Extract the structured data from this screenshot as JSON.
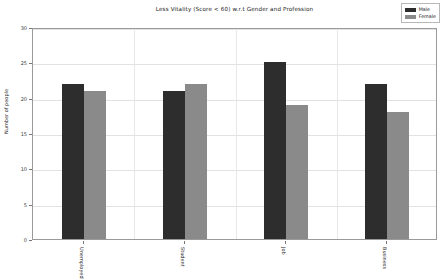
{
  "chart_data": {
    "type": "bar",
    "title": "Less Vitality (Score < 60) w.r.t Gender and Profession",
    "xlabel": "",
    "ylabel": "Number of people",
    "categories": [
      "Unemployed",
      "Student",
      "Job",
      "Business"
    ],
    "series": [
      {
        "name": "Male",
        "color": "#2d2d2d",
        "values": [
          22,
          21,
          25,
          22
        ]
      },
      {
        "name": "Female",
        "color": "#8a8a8a",
        "values": [
          21,
          22,
          19,
          18
        ]
      }
    ],
    "ylim": [
      0,
      30
    ],
    "yticks": [
      0,
      5,
      10,
      15,
      20,
      25,
      30
    ],
    "ytick_labels": [
      "0",
      "5",
      "10",
      "15",
      "20",
      "25",
      "30"
    ],
    "grid": true,
    "legend_position": "upper right"
  },
  "legend": {
    "entries": [
      {
        "label": "Male"
      },
      {
        "label": "Female"
      }
    ]
  }
}
